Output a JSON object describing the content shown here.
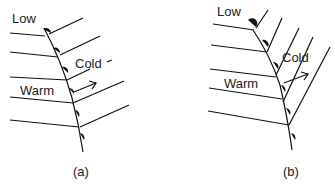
{
  "figure": {
    "panels": [
      {
        "id": "a",
        "caption": "(a)",
        "labels": {
          "low": "Low",
          "cold": "Cold",
          "warm": "Warm"
        }
      },
      {
        "id": "b",
        "caption": "(b)",
        "labels": {
          "low": "Low",
          "cold": "Cold",
          "warm": "Warm"
        }
      }
    ],
    "colors": {
      "line": "#111111",
      "background": "#ffffff"
    }
  }
}
